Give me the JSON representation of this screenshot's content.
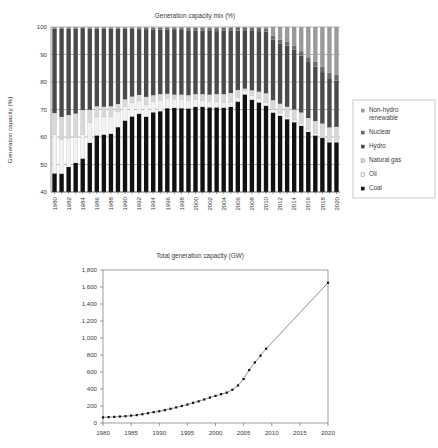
{
  "figure": {
    "background": "#ffffff"
  },
  "top_chart": {
    "title": "Generation capacity mix (%)",
    "ylabel": "Generation capacity (%)"
  },
  "bottom_chart": {
    "title": "Total generation capacity (GW)"
  },
  "legend": {
    "items": [
      {
        "label": "Non-hydro renewable",
        "line1": "Non-hydro",
        "line2": "renewable",
        "color": "#9a9a9a",
        "marker": "square-gray"
      },
      {
        "label": "Nuclear",
        "line1": "Nuclear",
        "line2": "",
        "color": "#6b6b6b",
        "marker": "square-dark-gray"
      },
      {
        "label": "Hydro",
        "line1": "Hydro",
        "line2": "",
        "color": "#4a4a4a",
        "marker": "square-darker"
      },
      {
        "label": "Natural gas",
        "line1": "Natural gas",
        "line2": "",
        "color": "#d8d8d8",
        "marker": "square-light"
      },
      {
        "label": "Oil",
        "line1": "Oil",
        "line2": "",
        "color": "#f2f2f2",
        "marker": "square-white"
      },
      {
        "label": "Coal",
        "line1": "Coal",
        "line2": "",
        "color": "#111111",
        "marker": "square-black"
      }
    ]
  },
  "chart_data": [
    {
      "type": "bar",
      "stacked": true,
      "title": "Generation capacity mix (%)",
      "xlabel": "",
      "ylabel": "Generation capacity (%)",
      "ylim": [
        40,
        100
      ],
      "yticks": [
        40,
        50,
        60,
        70,
        80,
        90,
        100
      ],
      "grid": true,
      "legend_position": "right",
      "categories": [
        1980,
        1981,
        1982,
        1983,
        1984,
        1985,
        1986,
        1987,
        1988,
        1989,
        1990,
        1991,
        1992,
        1993,
        1994,
        1995,
        1996,
        1997,
        1998,
        1999,
        2000,
        2001,
        2002,
        2003,
        2004,
        2005,
        2006,
        2007,
        2008,
        2009,
        2010,
        2011,
        2012,
        2013,
        2014,
        2015,
        2016,
        2017,
        2018,
        2019,
        2020
      ],
      "xtick_labels": [
        "1980",
        "1982",
        "1984",
        "1986",
        "1988",
        "1990",
        "1992",
        "1994",
        "1996",
        "1998",
        "2000",
        "2002",
        "2004",
        "2006",
        "2008",
        "2010",
        "2012",
        "2014",
        "2016",
        "2018",
        "2020"
      ],
      "series": [
        {
          "name": "Coal",
          "color": "#111111",
          "values": [
            46.8,
            46.7,
            49.1,
            50.6,
            52.2,
            57.9,
            60.6,
            60.9,
            61.2,
            63.6,
            66.0,
            67.5,
            68.5,
            67.4,
            69.0,
            69.4,
            70.5,
            70.6,
            70.5,
            70.4,
            71.0,
            71.0,
            70.8,
            70.8,
            70.7,
            71.0,
            72.9,
            75.5,
            73.6,
            72.6,
            71.4,
            68.9,
            67.7,
            66.5,
            65.4,
            64.1,
            61.9,
            60.6,
            59.7,
            58.1,
            58.1
          ]
        },
        {
          "name": "Oil",
          "color": "#f2f2f2",
          "values": [
            14.1,
            12.3,
            10.5,
            9.3,
            8.8,
            7.4,
            6.7,
            6.4,
            6.1,
            5.6,
            5.2,
            4.9,
            4.6,
            4.3,
            4.0,
            3.8,
            3.5,
            3.2,
            3.0,
            2.8,
            2.6,
            2.4,
            2.2,
            2.0,
            1.9,
            1.7,
            1.6,
            1.5,
            1.4,
            1.3,
            1.2,
            1.1,
            1.0,
            0.9,
            0.8,
            0.8,
            0.7,
            0.7,
            0.6,
            0.6,
            0.6
          ]
        },
        {
          "name": "Natural gas",
          "color": "#d8d8d8",
          "values": [
            7.8,
            8.3,
            8.4,
            8.6,
            8.8,
            4.6,
            3.9,
            3.7,
            3.9,
            2.8,
            2.5,
            2.3,
            2.2,
            2.9,
            2.2,
            2.4,
            1.7,
            1.6,
            1.9,
            2.0,
            2.0,
            2.2,
            2.4,
            2.8,
            3.0,
            3.3,
            2.6,
            0.6,
            2.0,
            2.6,
            3.3,
            3.4,
            3.4,
            3.6,
            3.8,
            4.0,
            4.3,
            4.5,
            4.6,
            4.8,
            5.0
          ]
        },
        {
          "name": "Hydro",
          "color": "#4a4a4a",
          "values": [
            30.8,
            32.2,
            31.5,
            31.0,
            29.8,
            29.6,
            28.3,
            28.5,
            28.3,
            27.5,
            25.7,
            24.6,
            23.9,
            24.6,
            23.8,
            23.4,
            23.3,
            23.5,
            23.5,
            23.6,
            23.2,
            23.1,
            23.2,
            22.9,
            23.0,
            22.6,
            21.6,
            21.2,
            21.6,
            22.0,
            22.4,
            22.0,
            21.8,
            22.2,
            21.8,
            20.7,
            20.4,
            19.8,
            18.7,
            17.9,
            16.8
          ]
        },
        {
          "name": "Nuclear",
          "color": "#6b6b6b",
          "values": [
            0.0,
            0.0,
            0.0,
            0.0,
            0.0,
            0.0,
            0.0,
            0.0,
            0.0,
            0.0,
            0.2,
            0.3,
            0.4,
            0.6,
            0.7,
            0.7,
            0.7,
            0.7,
            0.7,
            0.8,
            0.9,
            0.9,
            1.0,
            1.1,
            1.1,
            1.2,
            1.2,
            1.1,
            1.1,
            1.2,
            1.2,
            1.5,
            1.5,
            1.4,
            1.5,
            1.6,
            1.7,
            1.8,
            1.9,
            2.0,
            2.1
          ]
        },
        {
          "name": "Non-hydro renewable",
          "color": "#9a9a9a",
          "values": [
            0.5,
            0.5,
            0.5,
            0.5,
            0.4,
            0.5,
            0.5,
            0.5,
            0.5,
            0.5,
            0.4,
            0.4,
            0.4,
            0.2,
            0.3,
            0.3,
            0.3,
            0.4,
            0.4,
            0.4,
            0.3,
            0.4,
            0.4,
            0.4,
            0.3,
            0.2,
            0.1,
            0.1,
            0.3,
            0.3,
            0.5,
            3.1,
            4.6,
            5.4,
            6.7,
            8.8,
            11.0,
            12.6,
            14.5,
            16.6,
            17.4
          ]
        }
      ]
    },
    {
      "type": "line",
      "title": "Total generation capacity (GW)",
      "xlabel": "",
      "ylabel": "",
      "xlim": [
        1980,
        2020
      ],
      "ylim": [
        0,
        1800
      ],
      "yticks": [
        0,
        200,
        400,
        600,
        800,
        1000,
        1200,
        1400,
        1600,
        1800
      ],
      "ytick_labels": [
        "0",
        "200",
        "400",
        "600",
        "800",
        "1,000",
        "1,200",
        "1,400",
        "1,600",
        "1,800"
      ],
      "xticks": [
        1980,
        1985,
        1990,
        1995,
        2000,
        2005,
        2010,
        2015,
        2020
      ],
      "xtick_labels": [
        "1980",
        "1985",
        "1990",
        "1995",
        "2000",
        "2005",
        "2010",
        "2015",
        "2020"
      ],
      "grid": false,
      "marker": "square",
      "marker_color": "#111111",
      "line_color": "#555555",
      "x": [
        1980,
        1981,
        1982,
        1983,
        1984,
        1985,
        1986,
        1987,
        1988,
        1989,
        1990,
        1991,
        1992,
        1993,
        1994,
        1995,
        1996,
        1997,
        1998,
        1999,
        2000,
        2001,
        2002,
        2003,
        2004,
        2005,
        2006,
        2007,
        2008,
        2009,
        2020
      ],
      "values": [
        66,
        69,
        72,
        76,
        80,
        87,
        93,
        103,
        115,
        127,
        138,
        151,
        167,
        183,
        200,
        217,
        237,
        255,
        277,
        299,
        319,
        339,
        357,
        391,
        442,
        517,
        623,
        713,
        793,
        874,
        1650
      ],
      "annotation": "Markers shown through 2009; straight projection line continues to 2020"
    }
  ]
}
